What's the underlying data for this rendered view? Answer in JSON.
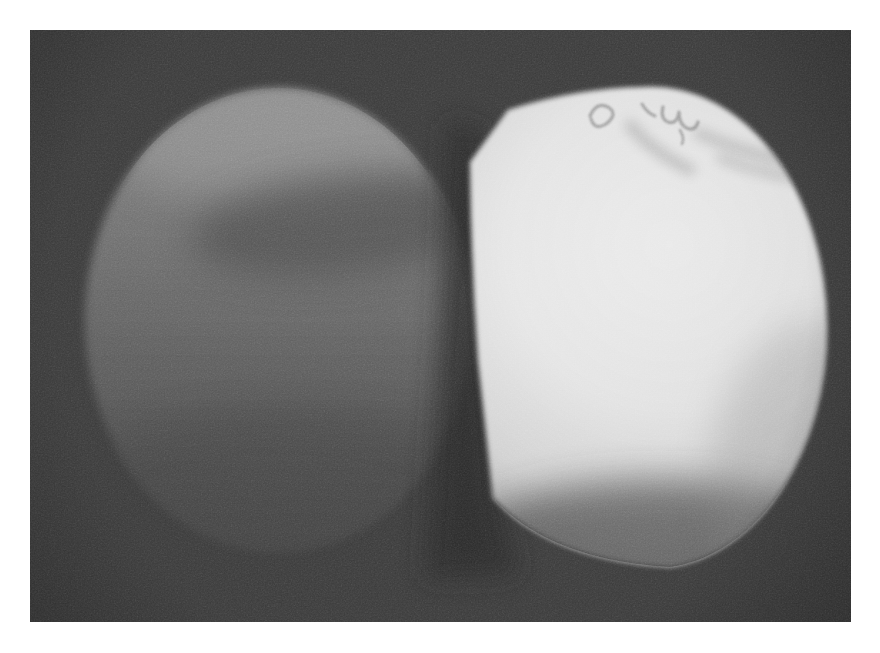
{
  "figure": {
    "kind": "black-and-white halftone photograph",
    "objects": [
      {
        "name": "left gray sphere",
        "legible_text": ""
      },
      {
        "name": "right white sphere",
        "legible_text": ""
      }
    ],
    "marking": "illegible handwritten scribble"
  },
  "colors": {
    "page_background": "#ffffff",
    "photo_background": "#3d3d3d",
    "vignette": "#1c1c1c",
    "left_sphere_top": "#929292",
    "left_sphere_upper": "#7b7b7b",
    "left_sphere_mid": "#676767",
    "left_sphere_lower": "#535353",
    "left_sphere_bottom": "#454545",
    "left_highlight": "#9d9d9d",
    "left_smudge": "#4e4e4e",
    "gap_shadow": "#2b2b2b",
    "sphere_core": "#f0f0f0",
    "sphere_bright": "#e8e8e8",
    "sphere_mid": "#d6d6d6",
    "sphere_shaded": "#b2b2b2",
    "sphere_rim": "#8d8d8d",
    "sphere_bottom_shadow": "#3c3c3c",
    "marking_ink": "#808080",
    "marking_smudge": "#a8a8a8"
  }
}
